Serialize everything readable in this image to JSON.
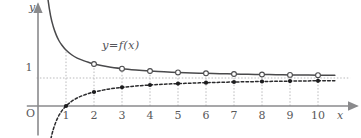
{
  "figure": {
    "origin_label": "O",
    "x_axis_label": "x",
    "y_axis_label": "y",
    "curve_label": "y=f(x)",
    "y_tick_label": "1"
  },
  "colors": {
    "axis": "#8a8a8c",
    "curve_solid": "#4a4a4c",
    "curve_dashed": "#2b2b2d",
    "grid": "#b9b9bb",
    "text": "#58585a",
    "background": "#ffffff",
    "marker_open_fill": "#ffffff",
    "marker_filled": "#1c1c1e"
  },
  "chart_data": {
    "type": "line",
    "title": "",
    "subtitle": "",
    "xlabel": "x",
    "ylabel": "y",
    "xlim": [
      -0.4,
      11.4
    ],
    "ylim": [
      -1.05,
      3.65
    ],
    "grid": true,
    "grid_style": "dotted",
    "legend": "inline-annotation",
    "annotations": [
      {
        "text": "y=f(x)",
        "x": 2.35,
        "y": 2.35
      }
    ],
    "asymptote": {
      "type": "horizontal",
      "y": 1,
      "style": "dotted"
    },
    "xticks": [
      1,
      2,
      3,
      4,
      5,
      6,
      7,
      8,
      9,
      10
    ],
    "xtick_labels": [
      "1",
      "2",
      "3",
      "4",
      "5",
      "6",
      "7",
      "8",
      "9",
      "10"
    ],
    "yticks": [
      1
    ],
    "ytick_labels": [
      "1"
    ],
    "series": [
      {
        "name": "y=f(x)",
        "style": "solid",
        "marker": "open-circle",
        "marker_x": [
          2,
          3,
          4,
          5,
          6,
          7,
          8,
          9,
          10
        ],
        "marker_y": [
          1.5,
          1.333,
          1.25,
          1.2,
          1.167,
          1.143,
          1.125,
          1.111,
          1.1
        ],
        "x": [
          0.28,
          0.35,
          0.45,
          0.55,
          0.65,
          0.75,
          0.85,
          1.0,
          1.2,
          1.4,
          1.6,
          1.8,
          2.0,
          2.5,
          3.0,
          3.5,
          4.0,
          4.5,
          5.0,
          5.5,
          6.0,
          6.5,
          7.0,
          7.5,
          8.0,
          8.5,
          9.0,
          9.5,
          10.0,
          10.6
        ],
        "y": [
          4.57,
          3.86,
          3.22,
          2.82,
          2.54,
          2.33,
          2.18,
          2.0,
          1.83,
          1.71,
          1.63,
          1.56,
          1.5,
          1.4,
          1.333,
          1.286,
          1.25,
          1.222,
          1.2,
          1.182,
          1.167,
          1.154,
          1.143,
          1.133,
          1.125,
          1.118,
          1.111,
          1.105,
          1.1,
          1.094
        ]
      },
      {
        "name": "g(x)",
        "style": "dashed",
        "marker": "filled-circle",
        "marker_x": [
          1,
          2,
          3,
          4,
          5,
          6,
          7,
          8,
          9,
          10
        ],
        "marker_y": [
          0.0,
          0.5,
          0.667,
          0.75,
          0.8,
          0.833,
          0.857,
          0.875,
          0.889,
          0.9
        ],
        "x": [
          0.46,
          0.5,
          0.55,
          0.6,
          0.65,
          0.7,
          0.75,
          0.8,
          0.85,
          0.9,
          0.95,
          1.0,
          1.2,
          1.4,
          1.6,
          1.8,
          2.0,
          2.5,
          3.0,
          3.5,
          4.0,
          4.5,
          5.0,
          5.5,
          6.0,
          6.5,
          7.0,
          7.5,
          8.0,
          8.5,
          9.0,
          9.5,
          10.0,
          10.6
        ],
        "y": [
          -1.17,
          -1.0,
          -0.82,
          -0.67,
          -0.54,
          -0.43,
          -0.33,
          -0.25,
          -0.176,
          -0.111,
          -0.053,
          0.0,
          0.167,
          0.286,
          0.375,
          0.444,
          0.5,
          0.6,
          0.667,
          0.714,
          0.75,
          0.778,
          0.8,
          0.818,
          0.833,
          0.846,
          0.857,
          0.867,
          0.875,
          0.882,
          0.889,
          0.895,
          0.9,
          0.906
        ]
      }
    ]
  }
}
